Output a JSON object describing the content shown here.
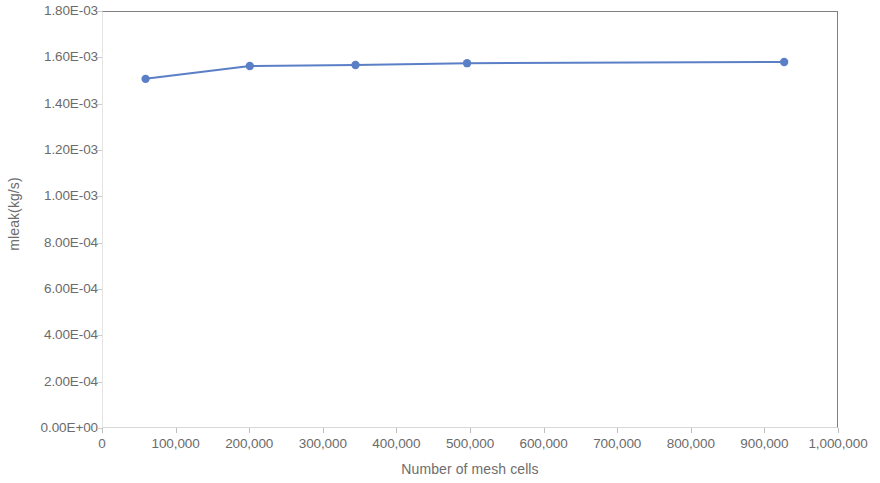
{
  "chart_data": {
    "type": "line",
    "title": "",
    "subtitle": "",
    "xlabel": "Number of mesh cells",
    "ylabel": "mleak(kg/s)",
    "xlim": [
      0,
      1000000
    ],
    "ylim": [
      0.0,
      0.0018
    ],
    "grid": false,
    "legend": "none",
    "marker": "circle",
    "line_color": "#5B7FC7",
    "marker_color": "#5B7FC7",
    "axis_color": "#808080",
    "tick_label_color": "#6B6B6B",
    "x": [
      58000,
      200000,
      344000,
      496000,
      928000
    ],
    "y": [
      0.00151,
      0.001566,
      0.00157,
      0.001578,
      0.001583
    ],
    "series": [
      {
        "name": "mleak",
        "x": [
          58000,
          200000,
          344000,
          496000,
          928000
        ],
        "values": [
          0.00151,
          0.001566,
          0.00157,
          0.001578,
          0.001583
        ]
      }
    ],
    "x_tick_values": [
      0,
      100000,
      200000,
      300000,
      400000,
      500000,
      600000,
      700000,
      800000,
      900000,
      1000000
    ],
    "x_tick_labels": [
      "0",
      "100,000",
      "200,000",
      "300,000",
      "400,000",
      "500,000",
      "600,000",
      "700,000",
      "800,000",
      "900,000",
      "1,000,000"
    ],
    "y_tick_values": [
      0.0,
      0.0002,
      0.0004,
      0.0006,
      0.0008,
      0.001,
      0.0012,
      0.0014,
      0.0016,
      0.0018
    ],
    "y_tick_labels": [
      "0.00E+00",
      "2.00E-04",
      "4.00E-04",
      "6.00E-04",
      "8.00E-04",
      "1.00E-03",
      "1.20E-03",
      "1.40E-03",
      "1.60E-03",
      "1.80E-03"
    ]
  }
}
